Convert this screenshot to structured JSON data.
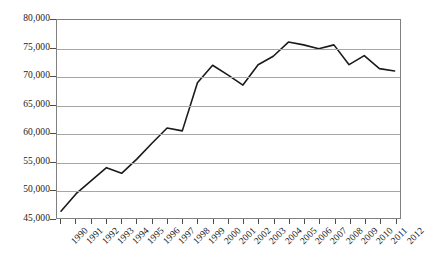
{
  "chart_data": {
    "type": "line",
    "title": "",
    "subtitle": "",
    "xlabel": "",
    "ylabel": "",
    "categories": [
      "1990",
      "1991",
      "1992",
      "1993",
      "1994",
      "1995",
      "1996",
      "1997",
      "1998",
      "1999",
      "2000",
      "2001",
      "2002",
      "2003",
      "2004",
      "2005",
      "2006",
      "2007",
      "2008",
      "2009",
      "2010",
      "2011",
      "2012"
    ],
    "values": [
      46200,
      49300,
      51600,
      53900,
      52900,
      55400,
      58200,
      60900,
      60400,
      68900,
      72000,
      70300,
      68500,
      72100,
      73600,
      76100,
      75600,
      74900,
      75600,
      72100,
      73700,
      71400,
      71000
    ],
    "series": [
      {
        "name": "",
        "values": [
          46200,
          49300,
          51600,
          53900,
          52900,
          55400,
          58200,
          60900,
          60400,
          68900,
          72000,
          70300,
          68500,
          72100,
          73600,
          76100,
          75600,
          74900,
          75600,
          72100,
          73700,
          71400,
          71000
        ],
        "color": "#1a1a1a"
      }
    ],
    "ylim": [
      45000,
      80000
    ],
    "ytick_values": [
      45000,
      50000,
      55000,
      60000,
      65000,
      70000,
      75000,
      80000
    ],
    "ytick_labels": [
      "45,000",
      "50,000",
      "55,000",
      "60,000",
      "65,000",
      "70,000",
      "75,000",
      "80,000"
    ],
    "grid": true,
    "grid_axis": "y",
    "legend": false,
    "legend_position": "none",
    "markers": false,
    "line_color": "#1a1a1a",
    "gridline_color": "#a6a6a6",
    "frame_color": "#808080",
    "background_color": "#ffffff"
  }
}
